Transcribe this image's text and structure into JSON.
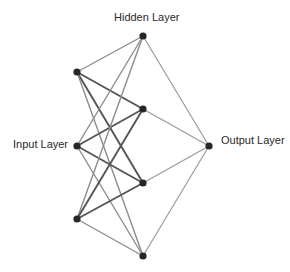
{
  "diagram": {
    "type": "neural-network",
    "labels": {
      "input": "Input Layer",
      "hidden": "Hidden Layer",
      "output": "Output Layer"
    },
    "colors": {
      "node": "#262626",
      "edge_strong": "#555555",
      "edge_weak": "#8c8c8c",
      "edge_output": "#9a9a9a",
      "background": "#ffffff"
    },
    "layers": [
      {
        "name": "input",
        "nodes": [
          {
            "id": "i1",
            "x": 77,
            "y": 72
          },
          {
            "id": "i2",
            "x": 77,
            "y": 146
          },
          {
            "id": "i3",
            "x": 77,
            "y": 219
          }
        ]
      },
      {
        "name": "hidden",
        "nodes": [
          {
            "id": "h1",
            "x": 143,
            "y": 36
          },
          {
            "id": "h2",
            "x": 143,
            "y": 109
          },
          {
            "id": "h3",
            "x": 143,
            "y": 183
          },
          {
            "id": "h4",
            "x": 143,
            "y": 256
          }
        ]
      },
      {
        "name": "output",
        "nodes": [
          {
            "id": "o1",
            "x": 209,
            "y": 146
          }
        ]
      }
    ],
    "edges": [
      {
        "from": "i1",
        "to": "h1",
        "weight": "weak"
      },
      {
        "from": "i1",
        "to": "h2",
        "weight": "strong"
      },
      {
        "from": "i1",
        "to": "h3",
        "weight": "strong"
      },
      {
        "from": "i1",
        "to": "h4",
        "weight": "weak"
      },
      {
        "from": "i2",
        "to": "h1",
        "weight": "weak"
      },
      {
        "from": "i2",
        "to": "h2",
        "weight": "strong"
      },
      {
        "from": "i2",
        "to": "h3",
        "weight": "strong"
      },
      {
        "from": "i2",
        "to": "h4",
        "weight": "weak"
      },
      {
        "from": "i3",
        "to": "h1",
        "weight": "weak"
      },
      {
        "from": "i3",
        "to": "h2",
        "weight": "strong"
      },
      {
        "from": "i3",
        "to": "h3",
        "weight": "strong"
      },
      {
        "from": "i3",
        "to": "h4",
        "weight": "weak"
      },
      {
        "from": "h1",
        "to": "o1",
        "weight": "output"
      },
      {
        "from": "h2",
        "to": "o1",
        "weight": "output"
      },
      {
        "from": "h3",
        "to": "o1",
        "weight": "output"
      },
      {
        "from": "h4",
        "to": "o1",
        "weight": "output"
      }
    ]
  }
}
